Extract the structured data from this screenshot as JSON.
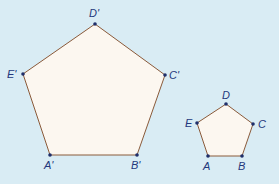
{
  "colors": {
    "background": "#d9ecf4",
    "fill": "#fcf7f0",
    "edge": "#8a5a3a",
    "vertex": "#1f2f6a",
    "label": "#24387c"
  },
  "large_pentagon": {
    "name": "A'B'C'D'E'",
    "vertices": {
      "A": {
        "label": "A'",
        "x": 50,
        "y": 155
      },
      "B": {
        "label": "B'",
        "x": 137,
        "y": 155
      },
      "C": {
        "label": "C'",
        "x": 165,
        "y": 75
      },
      "D": {
        "label": "D'",
        "x": 95,
        "y": 24
      },
      "E": {
        "label": "E'",
        "x": 23,
        "y": 74
      }
    }
  },
  "small_pentagon": {
    "name": "ABCDE",
    "vertices": {
      "A": {
        "label": "A",
        "x": 208,
        "y": 156
      },
      "B": {
        "label": "B",
        "x": 242,
        "y": 156
      },
      "C": {
        "label": "C",
        "x": 253,
        "y": 124
      },
      "D": {
        "label": "D",
        "x": 226,
        "y": 104
      },
      "E": {
        "label": "E",
        "x": 197,
        "y": 123
      }
    }
  }
}
